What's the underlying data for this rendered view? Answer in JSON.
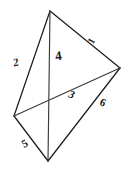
{
  "figure": {
    "kind": "hand-drawn-geometry-sketch",
    "canvas": {
      "width": 135,
      "height": 172,
      "background": "#ffffff"
    },
    "stroke_color": "#1d1d1d",
    "diagonal_color": "#3a3a3a",
    "vertices": [
      {
        "name": "top",
        "x": 50,
        "y": 11
      },
      {
        "name": "right",
        "x": 120,
        "y": 68
      },
      {
        "name": "bottom",
        "x": 48,
        "y": 161
      },
      {
        "name": "left",
        "x": 14,
        "y": 116
      }
    ],
    "edges": [
      {
        "name": "top-to-right",
        "from": "top",
        "to": "right"
      },
      {
        "name": "right-to-bottom",
        "from": "right",
        "to": "bottom"
      },
      {
        "name": "bottom-to-left",
        "from": "bottom",
        "to": "left"
      },
      {
        "name": "left-to-top",
        "from": "left",
        "to": "top"
      }
    ],
    "diagonals": [
      {
        "name": "vertical-diagonal",
        "from": "top",
        "to": "bottom"
      },
      {
        "name": "cross-diagonal",
        "from": "left",
        "to": "right"
      }
    ],
    "labels": {
      "left_upper": "2",
      "top_right": "1",
      "center": "4",
      "mid_lower": "3",
      "right_lower": "6",
      "bottom_left": "5"
    }
  }
}
